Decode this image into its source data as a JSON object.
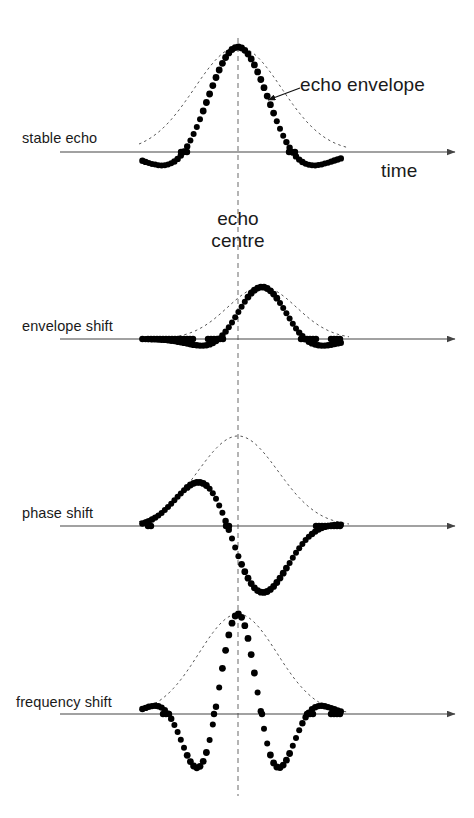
{
  "figure": {
    "background_color": "#ffffff",
    "ink_color": "#000000",
    "text_color": "#1a1a1a",
    "envelope_color": "#555555",
    "centre_line_color": "#777777",
    "axis_color": "#444444"
  },
  "annotations": {
    "axis_label": "time",
    "envelope_callout": "echo envelope",
    "centre_label_line1": "echo",
    "centre_label_line2": "centre"
  },
  "panels": [
    {
      "id": "stable-echo",
      "label": "stable echo",
      "baseline_y": 152,
      "envelope_peak_y": 47,
      "envelope_centre_x": 238,
      "envelope_half_width": 78,
      "envelope_shift": 0,
      "phase": 0,
      "frequency": 1.0,
      "amplitude": 105,
      "label_x": 22,
      "label_y": 130
    },
    {
      "id": "envelope-shift",
      "label": "envelope shift",
      "baseline_y": 339,
      "envelope_peak_y": 290,
      "envelope_centre_x": 262,
      "envelope_half_width": 62,
      "envelope_shift": 24,
      "phase": 0,
      "frequency": 1.0,
      "amplitude": 52,
      "label_x": 22,
      "label_y": 318
    },
    {
      "id": "phase-shift",
      "label": "phase shift",
      "baseline_y": 526,
      "envelope_peak_y": 440,
      "envelope_centre_x": 238,
      "envelope_half_width": 72,
      "envelope_shift": 0,
      "phase": 1.9,
      "frequency": 1.0,
      "amplitude": 90,
      "label_x": 22,
      "label_y": 505
    },
    {
      "id": "frequency-shift",
      "label": "frequency shift",
      "baseline_y": 714,
      "envelope_peak_y": 600,
      "envelope_centre_x": 238,
      "envelope_half_width": 70,
      "envelope_shift": 0,
      "phase": 0,
      "frequency": 2.1,
      "amplitude": 100,
      "label_x": 16,
      "label_y": 694
    }
  ],
  "axis": {
    "x_start": 60,
    "x_end": 455,
    "arrow_tip_x": 455,
    "time_label_x": 381,
    "time_label_y": 160,
    "envelope_callout_x": 300,
    "envelope_callout_y": 74,
    "callout_arrow_from_x": 300,
    "callout_arrow_from_y": 88,
    "callout_arrow_to_x": 268,
    "callout_arrow_to_y": 100,
    "centre_label_x": 238,
    "centre_label_y": 211,
    "centre_line_x": 238,
    "centre_line_top": 38,
    "centre_line_bottom": 796
  },
  "chart_data": {
    "type": "line",
    "xlabel": "time",
    "ylabel": "",
    "series": [
      {
        "name": "stable echo",
        "envelope_centre": 0,
        "phase_deg": 0,
        "relative_frequency": 1.0,
        "relative_amplitude": 1.0,
        "note": "echo peak coincides with echo centre"
      },
      {
        "name": "envelope shift",
        "envelope_centre": 24,
        "phase_deg": 0,
        "relative_frequency": 1.0,
        "relative_amplitude": 0.5,
        "note": "envelope maximum displaced to the right of echo centre"
      },
      {
        "name": "phase shift",
        "envelope_centre": 0,
        "phase_deg": 109,
        "relative_frequency": 1.0,
        "relative_amplitude": 0.86,
        "note": "envelope centred but oscillation phase rotated"
      },
      {
        "name": "frequency shift",
        "envelope_centre": 0,
        "phase_deg": 0,
        "relative_frequency": 2.1,
        "relative_amplitude": 0.95,
        "note": "oscillation frequency increased within unchanged envelope"
      }
    ]
  }
}
